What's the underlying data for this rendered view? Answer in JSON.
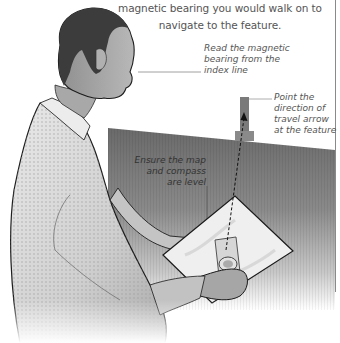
{
  "intro_text": {
    "line1": "magnetic bearing you would walk on to",
    "line2": "navigate to the feature."
  },
  "callouts": [
    {
      "id": "read-bearing",
      "lines": [
        "Read the magnetic",
        "bearing from the",
        "index line"
      ]
    },
    {
      "id": "point-arrow",
      "lines": [
        "Point the",
        "direction of",
        "travel arrow",
        "at the feature"
      ]
    },
    {
      "id": "level",
      "lines": [
        "Ensure the map",
        "and compass",
        "are level"
      ]
    }
  ],
  "illustration": {
    "subject": "man holding map and compass",
    "feature": "tower on horizon",
    "colors": {
      "ink": "#222222",
      "water_dark": "#6e6e6e",
      "water_light": "#ffffff",
      "shirt": "#d8d8d8",
      "skin": "#9a9a9a",
      "hair": "#3a3a3a",
      "map": "#eeeeee",
      "leader": "#888888"
    }
  }
}
